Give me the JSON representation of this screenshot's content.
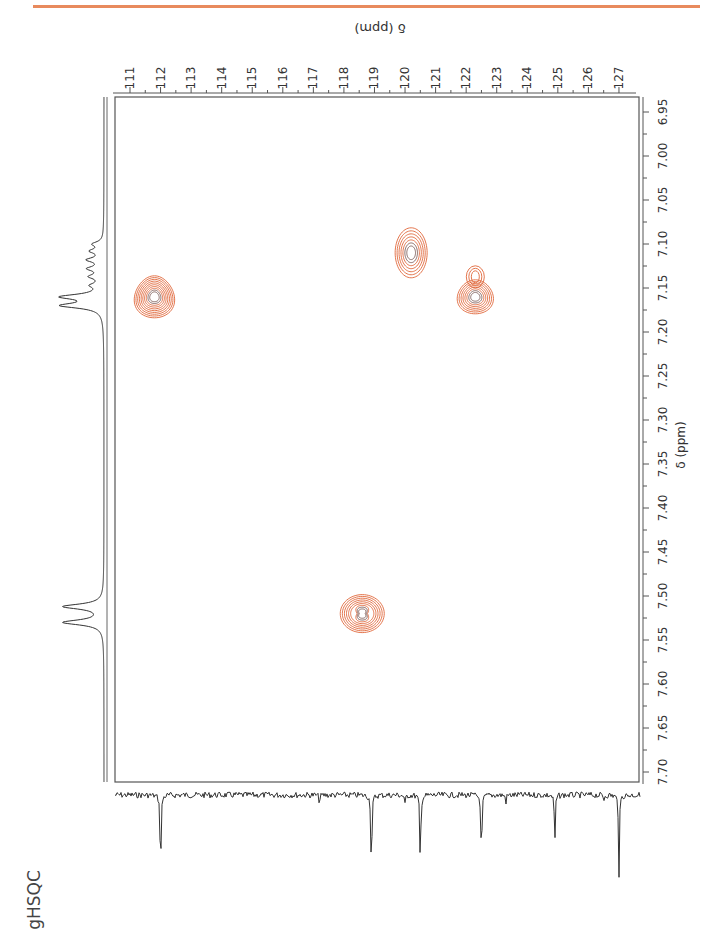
{
  "page": {
    "title": "gHSQC",
    "accent_color": "#e88a5d"
  },
  "chart_data": {
    "type": "heatmap",
    "subtype": "2D NMR gHSQC contour plot (page rotated 90° CCW)",
    "title": "gHSQC",
    "xlabel": "δ (ppm)",
    "ylabel": "δ (ppm)",
    "f2_proton_axis": {
      "label": "δ (ppm)",
      "range": [
        6.95,
        7.7
      ],
      "ticks": [
        "6.95",
        "7.00",
        "7.05",
        "7.10",
        "7.15",
        "7.20",
        "7.25",
        "7.30",
        "7.35",
        "7.40",
        "7.45",
        "7.50",
        "7.55",
        "7.60",
        "7.65",
        "7.70"
      ]
    },
    "f1_carbon_axis": {
      "label": "δ (ppm)",
      "range": [
        110.5,
        127.5
      ],
      "ticks": [
        "111",
        "112",
        "113",
        "114",
        "115",
        "116",
        "117",
        "118",
        "119",
        "120",
        "121",
        "122",
        "123",
        "124",
        "125",
        "126",
        "127"
      ]
    },
    "cross_peaks": [
      {
        "h_ppm": 7.16,
        "c_ppm": 111.8
      },
      {
        "h_ppm": 7.11,
        "c_ppm": 120.2
      },
      {
        "h_ppm": 7.16,
        "c_ppm": 122.3
      },
      {
        "h_ppm": 7.52,
        "c_ppm": 118.6
      }
    ],
    "proton_1d_peaks_ppm": [
      7.1,
      7.12,
      7.13,
      7.14,
      7.16,
      7.17,
      7.51,
      7.53
    ],
    "carbon_1d_peaks_ppm": [
      112.0,
      118.9,
      120.5,
      122.5,
      124.9,
      127.0
    ],
    "contour_color": "#e0663a",
    "grid": false
  }
}
